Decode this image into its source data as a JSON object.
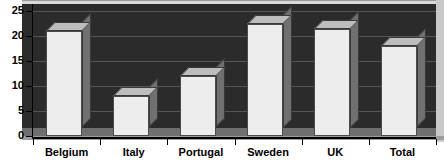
{
  "chart_data": {
    "type": "bar",
    "title": "",
    "subtitle": "",
    "xlabel": "",
    "ylabel": "",
    "categories": [
      "Belgium",
      "Italy",
      "Portugal",
      "Sweden",
      "UK",
      "Total"
    ],
    "values": [
      21,
      8,
      12,
      22.5,
      21.5,
      18
    ],
    "ylim": [
      0,
      25
    ],
    "yticks": [
      0,
      5,
      10,
      15,
      20,
      25
    ],
    "ytick_labels": [
      "0",
      "5",
      "10",
      "15",
      "20",
      "25"
    ],
    "grid": true,
    "grid_axis": "y",
    "legend": false,
    "legend_position": "none",
    "style": "3d-column",
    "series": [
      {
        "name": "",
        "values": [
          21,
          8,
          12,
          22.5,
          21.5,
          18
        ]
      }
    ],
    "colors": {
      "plot_background": "#2b2b2b",
      "gridline": "#565656",
      "bar_front": "#ededed",
      "bar_side": "#707070",
      "bar_top": "#bdbdbd",
      "axis": "#000000",
      "floor": "#6f6f6f",
      "page_background": "#ffffff"
    }
  }
}
